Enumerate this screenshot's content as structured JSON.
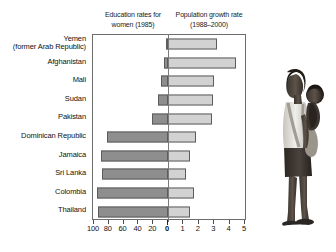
{
  "headings": {
    "left": "Education rates for women (1985)",
    "left_line1": "Education rates for",
    "left_line2": "women (1985)",
    "right": "Population growth rate (1988–2000)",
    "right_line1": "Population growth",
    "right_line2": "rate (1988–2000)"
  },
  "photo": {
    "alt": "Photograph of a woman carrying a baby on her back"
  },
  "chart_data": {
    "type": "bar",
    "orientation": "horizontal-diverging",
    "title": "",
    "categories": [
      "Yemen (former Arab Republic)",
      "Afghanistan",
      "Mali",
      "Sudan",
      "Pakistan",
      "Dominican Republic",
      "Jamaica",
      "Sri Lanka",
      "Colombia",
      "Thailand"
    ],
    "category_lines": [
      [
        "Yemen",
        "(former Arab Republic)"
      ],
      [
        "Afghanistan"
      ],
      [
        "Mali"
      ],
      [
        "Sudan"
      ],
      [
        "Pakistan"
      ],
      [
        "Dominican Republic"
      ],
      [
        "Jamaica"
      ],
      [
        "Sri Lanka"
      ],
      [
        "Colombia"
      ],
      [
        "Thailand"
      ]
    ],
    "series": [
      {
        "name": "Education rates for women (1985)",
        "axis": "left",
        "direction": "left",
        "unit": "%",
        "color": "#8e8e8e",
        "axis_label": "Education rates for women (1985)",
        "ticks": [
          100,
          80,
          60,
          40,
          20,
          0
        ],
        "range": [
          0,
          100
        ],
        "values": [
          3,
          6,
          10,
          14,
          22,
          83,
          90,
          89,
          96,
          94
        ]
      },
      {
        "name": "Population growth rate (1988–2000)",
        "axis": "right",
        "direction": "right",
        "unit": "%",
        "color": "#d2d2d2",
        "axis_label": "Population growth rate (1988–2000)",
        "ticks": [
          0,
          1,
          2,
          3,
          4,
          5
        ],
        "range": [
          0,
          5
        ],
        "values": [
          3.2,
          4.4,
          3.0,
          2.9,
          2.85,
          1.8,
          1.4,
          1.2,
          1.7,
          1.4
        ]
      }
    ],
    "left_tick_labels": [
      "100",
      "80",
      "60",
      "40",
      "20",
      "0"
    ],
    "right_tick_labels": [
      "0",
      "1",
      "2",
      "3",
      "4",
      "5"
    ],
    "grid": false,
    "legend": "none",
    "xlabel": "",
    "ylabel": ""
  }
}
